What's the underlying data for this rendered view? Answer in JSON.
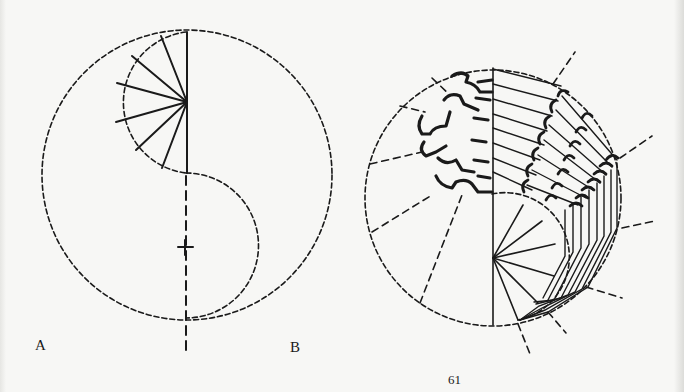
{
  "figure": {
    "panels": [
      {
        "label": "A",
        "description": "Dashed circle with S-curve divider; fan of radial lines in upper semicircle; center cross mark; dashed vertical axis"
      },
      {
        "label": "B",
        "description": "Dashed circle with radial dashed guides; fanned radial lines from lower center; stacked folded/extruded profile sections rotating around the axis"
      }
    ],
    "page_number": "61"
  },
  "colors": {
    "ink": "#1a1a1a",
    "paper": "#f7f7f5"
  }
}
